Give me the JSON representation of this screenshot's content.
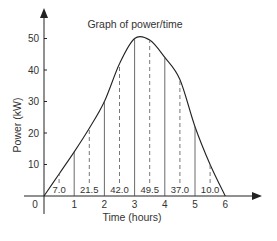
{
  "chart_data": {
    "type": "line",
    "title": "Graph of power/time",
    "xlabel": "Time (hours)",
    "ylabel": "Power (kW)",
    "xlim": [
      0,
      6
    ],
    "ylim": [
      0,
      55
    ],
    "x_ticks": [
      "0",
      "1",
      "2",
      "3",
      "4",
      "5",
      "6"
    ],
    "y_ticks": [
      "10",
      "20",
      "30",
      "40",
      "50"
    ],
    "grid": false,
    "legend": null,
    "curve": {
      "x": [
        0,
        0.5,
        1,
        1.5,
        2,
        2.5,
        3,
        3.5,
        4,
        4.5,
        5,
        5.5,
        6
      ],
      "y": [
        0,
        7,
        14,
        21.5,
        30,
        42,
        50,
        49.5,
        44,
        37,
        22,
        10,
        0
      ]
    },
    "strip_boundaries": [
      1,
      2,
      3,
      4,
      5
    ],
    "midordinates": {
      "x": [
        0.5,
        1.5,
        2.5,
        3.5,
        4.5,
        5.5
      ],
      "values": [
        7.0,
        21.5,
        42.0,
        49.5,
        37.0,
        10.0
      ],
      "labels": [
        "7.0",
        "21.5",
        "42.0",
        "49.5",
        "37.0",
        "10.0"
      ]
    },
    "annotations": "Solid vertical lines at hour boundaries; dashed mid-ordinates at half hours, labelled with their heights"
  }
}
